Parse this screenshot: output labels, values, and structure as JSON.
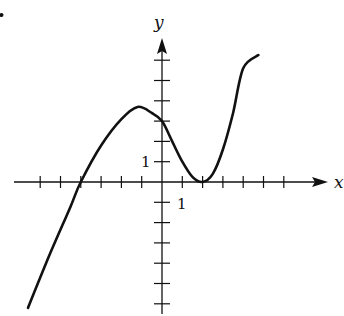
{
  "chart_data": {
    "type": "line",
    "title": "",
    "xlabel": "x",
    "ylabel": "y",
    "xlim": [
      -6,
      7.5
    ],
    "ylim": [
      -6,
      7
    ],
    "grid": false,
    "legend": null,
    "x_tick_count_left": 6,
    "x_tick_count_right": 6,
    "y_tick_count_up": 6,
    "y_tick_count_down": 6,
    "tick_labels": [
      {
        "axis": "y",
        "value": 1,
        "text": "1"
      },
      {
        "axis": "x",
        "value": 1,
        "text": "1"
      }
    ],
    "annotations": [
      {
        "text": "root at x = -4"
      },
      {
        "text": "local max near (-1.2, 3.7)"
      },
      {
        "text": "y-intercept (0, 3)"
      },
      {
        "text": "local min / double root at (2, 0)"
      }
    ],
    "series": [
      {
        "name": "f(x)",
        "points": [
          [
            -6.6,
            -6.2
          ],
          [
            -5.5,
            -3.5
          ],
          [
            -4.5,
            -1.2
          ],
          [
            -4.0,
            0
          ],
          [
            -3.0,
            1.8
          ],
          [
            -2.0,
            3.1
          ],
          [
            -1.2,
            3.7
          ],
          [
            -0.5,
            3.4
          ],
          [
            0,
            3.0
          ],
          [
            0.5,
            2.0
          ],
          [
            1.0,
            1.0
          ],
          [
            1.5,
            0.25
          ],
          [
            2.0,
            0
          ],
          [
            2.5,
            0.4
          ],
          [
            3.0,
            1.6
          ],
          [
            3.5,
            3.4
          ],
          [
            4.0,
            5.6
          ],
          [
            4.75,
            6.25
          ]
        ]
      }
    ]
  },
  "figure": {
    "marker_dot": true
  }
}
